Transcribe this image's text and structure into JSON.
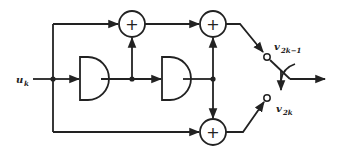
{
  "diagram": {
    "type": "block-diagram",
    "input": {
      "label": "u",
      "subscript": "k"
    },
    "delays": [
      {
        "id": "delay-1",
        "shape": "D-half-circle"
      },
      {
        "id": "delay-2",
        "shape": "D-half-circle"
      }
    ],
    "adders": [
      {
        "id": "adder-top-left",
        "symbol": "+"
      },
      {
        "id": "adder-top-right",
        "symbol": "+"
      },
      {
        "id": "adder-bottom",
        "symbol": "+"
      }
    ],
    "outputs": [
      {
        "label": "v",
        "subscript": "2k−1"
      },
      {
        "label": "v",
        "subscript": "2k"
      }
    ],
    "switch": {
      "type": "commutator"
    },
    "colors": {
      "ink": "#222222",
      "background": "#ffffff"
    }
  }
}
